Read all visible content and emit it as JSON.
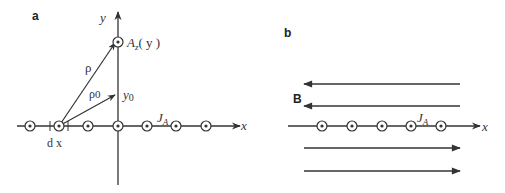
{
  "panel_a": {
    "label": "a",
    "y_axis_label": "y",
    "x_axis_label": "x",
    "point_label": "A",
    "point_label_sub": "z",
    "point_label_arg": "( y )",
    "rho_label": "ρ",
    "rho0_label": "ρ",
    "rho0_sub": "0",
    "y0_label": "y",
    "y0_sub": "0",
    "current_label": "J",
    "current_sub": "A",
    "dx_label": "d x",
    "current_positions_x": [
      30,
      59,
      88,
      118,
      147,
      176,
      206
    ]
  },
  "panel_b": {
    "label": "b",
    "field_label": "B",
    "x_axis_label": "x",
    "current_label": "J",
    "current_sub": "A",
    "current_positions_x": [
      322,
      352,
      382,
      411,
      441
    ],
    "field_arrows": [
      {
        "y": 84,
        "direction": "left"
      },
      {
        "y": 106,
        "direction": "left"
      },
      {
        "y": 148,
        "direction": "right"
      },
      {
        "y": 171,
        "direction": "right"
      }
    ]
  },
  "colors": {
    "line": "#333333",
    "background": "#ffffff"
  }
}
